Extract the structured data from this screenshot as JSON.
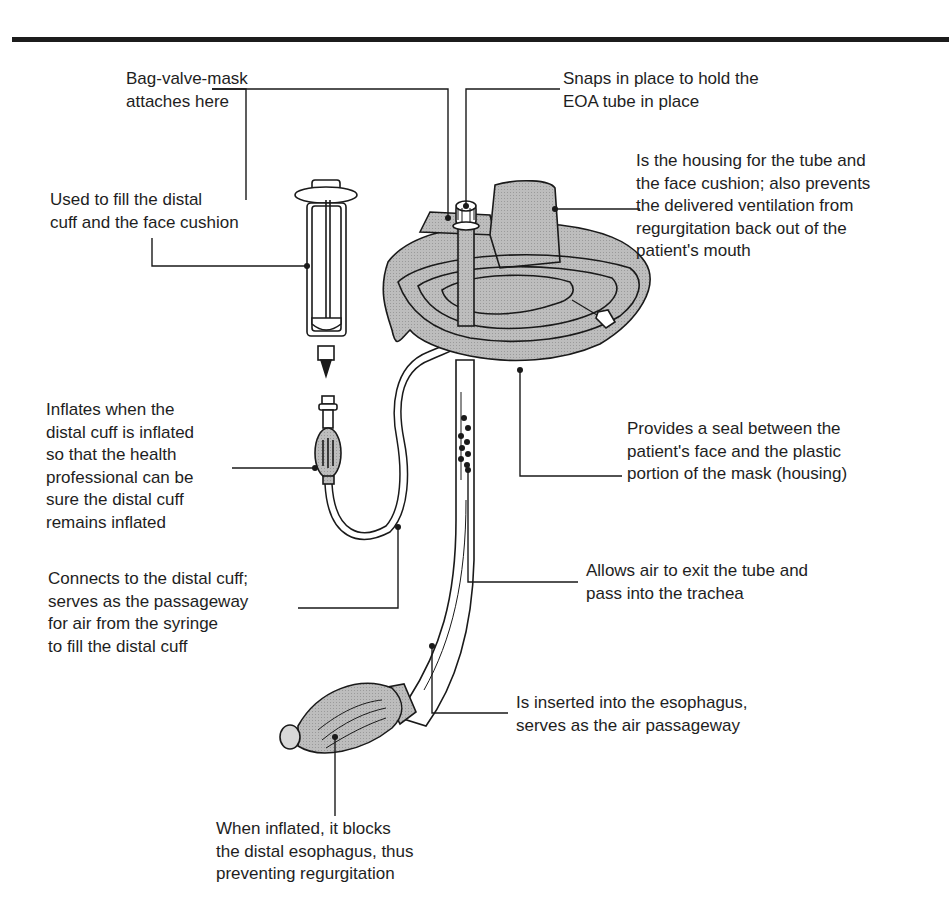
{
  "figure": {
    "fill_color": "#b8b8b8",
    "line_color": "#1a1a1a"
  },
  "labels": {
    "bvm_attach": "Bag-valve-mask\nattaches here",
    "snaps": "Snaps in place to hold the\nEOA tube in place",
    "housing": "Is the housing for the tube and\nthe face cushion; also prevents\nthe delivered ventilation from\nregurgitation back out of the\npatient's mouth",
    "syringe": "Used to fill the distal\ncuff and the face cushion",
    "pilot_balloon": "Inflates when the\ndistal cuff is inflated\nso that the health\nprofessional can be\nsure the distal cuff\nremains inflated",
    "face_cushion": "Provides a seal between the\npatient's face and the plastic\nportion of the mask  (housing)",
    "inflation_line": "Connects to the distal cuff;\nserves as the passageway\nfor air from the syringe\nto fill the distal cuff",
    "air_holes": "Allows air to exit the tube and\npass into the trachea",
    "esophageal_tube": "Is inserted into the esophagus,\nserves as the air passageway",
    "distal_cuff": "When inflated, it blocks\nthe distal esophagus, thus\npreventing regurgitation"
  }
}
